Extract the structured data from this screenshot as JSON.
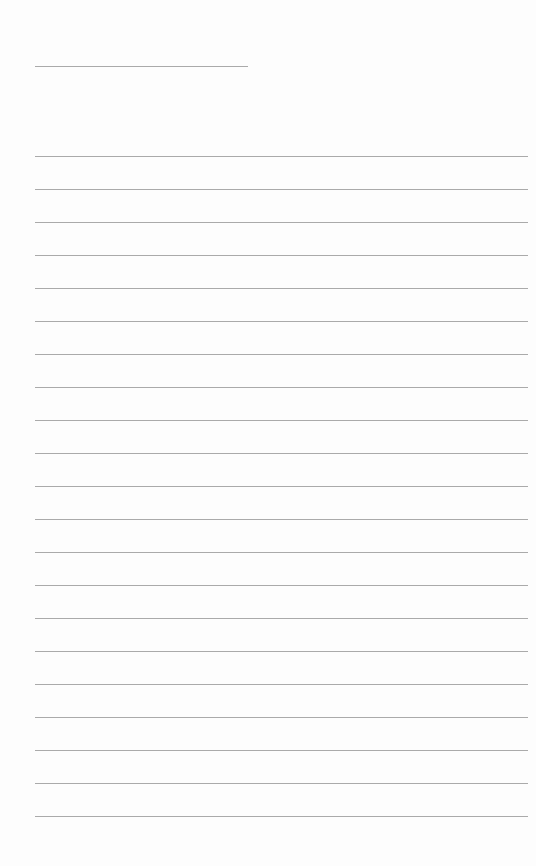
{
  "document": {
    "type": "lined-notebook-page",
    "background_color": "#fdfdfd",
    "line_color": "#aaaaaa",
    "header_line": {
      "x": 35,
      "y": 66,
      "width": 213
    },
    "ruled_lines": {
      "count": 21,
      "x": 35,
      "width": 493,
      "first_y": 156,
      "spacing": 33
    },
    "written_content": []
  }
}
